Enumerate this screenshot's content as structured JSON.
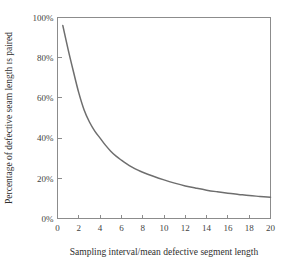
{
  "chart_data": {
    "type": "line",
    "title": "",
    "xlabel": "Sampling interval/mean defective segment length",
    "ylabel": "Percentage of defective seam length ɪs paired",
    "xlim": [
      0,
      20
    ],
    "ylim": [
      0,
      100
    ],
    "grid": false,
    "legend": false,
    "xticks": [
      0,
      2,
      4,
      6,
      8,
      10,
      12,
      14,
      16,
      18,
      20
    ],
    "xtick_labels": [
      "0",
      "2",
      "4",
      "6",
      "8",
      "10",
      "12",
      "14",
      "16",
      "18",
      "20"
    ],
    "yticks": [
      0,
      20,
      40,
      60,
      80,
      100
    ],
    "ytick_labels": [
      "0%",
      "20%",
      "40%",
      "60%",
      "80%",
      "100%"
    ],
    "series": [
      {
        "name": "Percentage of defective seam length is paired",
        "color": "#6e6e6e",
        "x": [
          0.5,
          1.0,
          1.5,
          2.0,
          2.5,
          3.0,
          3.5,
          4.0,
          4.5,
          5.0,
          5.5,
          6.0,
          6.5,
          7.0,
          7.5,
          8.0,
          9.0,
          10.0,
          11.0,
          12.0,
          13.0,
          14.0,
          15.0,
          16.0,
          17.0,
          18.0,
          19.0,
          20.0
        ],
        "y": [
          96.0,
          84.0,
          73.0,
          62.5,
          54.0,
          48.0,
          43.5,
          40.0,
          36.5,
          33.5,
          31.0,
          29.0,
          27.2,
          25.6,
          24.2,
          23.0,
          21.0,
          19.2,
          17.6,
          16.2,
          15.1,
          14.1,
          13.3,
          12.6,
          12.0,
          11.4,
          11.0,
          10.6
        ]
      }
    ]
  },
  "axis_titles": {
    "x": "Sampling interval/mean defective segment length",
    "y": "Percentage of defective seam length ɪs paired"
  }
}
